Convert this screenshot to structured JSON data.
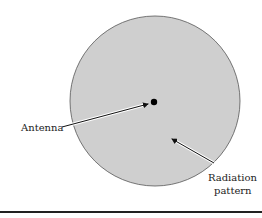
{
  "diagram": {
    "labels": {
      "antenna": "Antenna",
      "radiation_line1": "Radiation",
      "radiation_line2": "pattern"
    },
    "colors": {
      "pattern_fill": "#cfcfcf",
      "pattern_stroke": "#555555",
      "antenna": "#000000",
      "rule": "#222222"
    }
  }
}
